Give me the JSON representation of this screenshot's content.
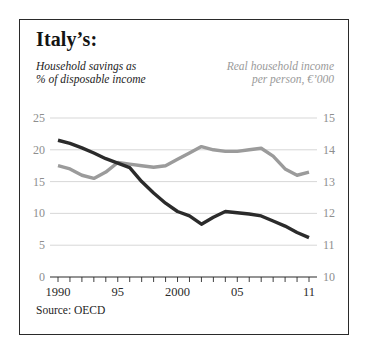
{
  "title": "Italy’s:",
  "subtitle_left": "Household savings as\n% of disposable income",
  "subtitle_left_line1": "Household savings as",
  "subtitle_left_line2": "% of disposable income",
  "subtitle_right_line1": "Real household income",
  "subtitle_right_line2": "per person, €’000",
  "source": "Source: OECD",
  "colors": {
    "dark_series": "#2b2b2b",
    "light_series": "#9b9b9b",
    "gridline": "#d3d3d3",
    "axis_text": "#8e8e8e",
    "border": "#2a2a2a",
    "title_text": "#141414",
    "background": "#ffffff"
  },
  "chart_data": {
    "type": "line",
    "title": "Italy’s:",
    "xlabel": "",
    "ylabel": "Household savings as % of disposable income",
    "y2label": "Real household income per person, €’000",
    "grid": true,
    "legend": "none",
    "x": [
      1990,
      1991,
      1992,
      1993,
      1994,
      1995,
      1996,
      1997,
      1998,
      1999,
      2000,
      2001,
      2002,
      2003,
      2004,
      2005,
      2006,
      2007,
      2008,
      2009,
      2010,
      2011
    ],
    "xlim": [
      1990,
      2011
    ],
    "xtick_labels": [
      "1990",
      "95",
      "2000",
      "05",
      "11"
    ],
    "xtick_values": [
      1990,
      1995,
      2000,
      2005,
      2011
    ],
    "ylim": [
      0,
      25
    ],
    "ytick_values": [
      0,
      5,
      10,
      15,
      20,
      25
    ],
    "ytick_labels": [
      "0",
      "5",
      "10",
      "15",
      "20",
      "25"
    ],
    "y2lim": [
      10,
      15
    ],
    "y2tick_values": [
      10,
      11,
      12,
      13,
      14,
      15
    ],
    "y2tick_labels": [
      "10",
      "11",
      "12",
      "13",
      "14",
      "15"
    ],
    "series": [
      {
        "name": "Household savings as % of disposable income",
        "axis": "left",
        "color": "#2b2b2b",
        "values": [
          21.5,
          21.0,
          20.3,
          19.5,
          18.6,
          17.9,
          17.2,
          15.0,
          13.2,
          11.6,
          10.3,
          9.6,
          8.3,
          9.4,
          10.3,
          10.1,
          9.9,
          9.6,
          8.8,
          8.0,
          7.0,
          6.2
        ]
      },
      {
        "name": "Real household income per person, €’000",
        "axis": "right",
        "color": "#9b9b9b",
        "values": [
          13.5,
          13.4,
          13.2,
          13.1,
          13.3,
          13.6,
          13.55,
          13.5,
          13.45,
          13.5,
          13.7,
          13.9,
          14.1,
          14.0,
          13.95,
          13.95,
          14.0,
          14.05,
          13.8,
          13.4,
          13.2,
          13.3
        ]
      }
    ]
  }
}
